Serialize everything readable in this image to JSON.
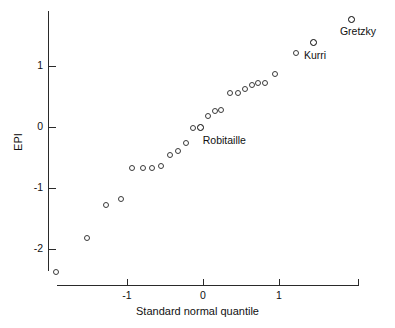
{
  "chart_data": {
    "type": "scatter",
    "title": "",
    "xlabel": "Standard normal quantile",
    "ylabel": "EPI",
    "xlim": [
      -2.1,
      2.1
    ],
    "ylim": [
      -2.55,
      1.95
    ],
    "grid": false,
    "legend": null,
    "xticks": [
      -1,
      0,
      1
    ],
    "xtick_labels": [
      "-1",
      "0",
      "1"
    ],
    "yticks": [
      -2,
      -1,
      0,
      1
    ],
    "ytick_labels": [
      "-2",
      "-1",
      "0",
      "1"
    ],
    "points": [
      {
        "x": -1.93,
        "y": -2.38,
        "label": null
      },
      {
        "x": -1.53,
        "y": -1.82,
        "label": null
      },
      {
        "x": -1.27,
        "y": -1.28,
        "label": null
      },
      {
        "x": -1.08,
        "y": -1.18,
        "label": null
      },
      {
        "x": -0.94,
        "y": -0.67,
        "label": null
      },
      {
        "x": -0.79,
        "y": -0.67,
        "label": null
      },
      {
        "x": -0.67,
        "y": -0.67,
        "label": null
      },
      {
        "x": -0.55,
        "y": -0.64,
        "label": null
      },
      {
        "x": -0.43,
        "y": -0.46,
        "label": null
      },
      {
        "x": -0.33,
        "y": -0.39,
        "label": null
      },
      {
        "x": -0.23,
        "y": -0.26,
        "label": null
      },
      {
        "x": -0.13,
        "y": -0.02,
        "label": null
      },
      {
        "x": -0.03,
        "y": 0.0,
        "label": "Robitaille"
      },
      {
        "x": 0.07,
        "y": 0.18,
        "label": null
      },
      {
        "x": 0.16,
        "y": 0.26,
        "label": null
      },
      {
        "x": 0.24,
        "y": 0.28,
        "label": null
      },
      {
        "x": 0.36,
        "y": 0.56,
        "label": null
      },
      {
        "x": 0.46,
        "y": 0.56,
        "label": null
      },
      {
        "x": 0.55,
        "y": 0.62,
        "label": null
      },
      {
        "x": 0.64,
        "y": 0.69,
        "label": null
      },
      {
        "x": 0.72,
        "y": 0.72,
        "label": null
      },
      {
        "x": 0.82,
        "y": 0.72,
        "label": null
      },
      {
        "x": 0.95,
        "y": 0.87,
        "label": null
      },
      {
        "x": 1.22,
        "y": 1.21,
        "label": null
      },
      {
        "x": 1.46,
        "y": 1.38,
        "label": "Kurri"
      },
      {
        "x": 1.96,
        "y": 1.77,
        "label": "Gretzky"
      }
    ],
    "annotations": [
      {
        "text": "Gretzky",
        "x": 1.96,
        "y": 1.77
      },
      {
        "text": "Kurri",
        "x": 1.46,
        "y": 1.38
      },
      {
        "text": "Robitaille",
        "x": -0.03,
        "y": 0.0
      }
    ],
    "colors": {
      "axis": "#2a2a2a",
      "marker": "#3a3a3a",
      "marker_highlight": "#000000",
      "text": "#111111",
      "background": "#ffffff"
    }
  }
}
